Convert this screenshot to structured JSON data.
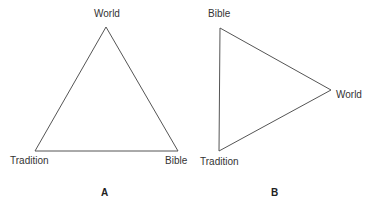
{
  "diagrams": [
    {
      "caption": "A",
      "vertices": [
        {
          "label": "World",
          "x": 106,
          "y": 27
        },
        {
          "label": "Tradition",
          "x": 35,
          "y": 151
        },
        {
          "label": "Bible",
          "x": 178,
          "y": 151
        }
      ]
    },
    {
      "caption": "B",
      "vertices": [
        {
          "label": "Bible",
          "x": 220,
          "y": 28
        },
        {
          "label": "World",
          "x": 331,
          "y": 90
        },
        {
          "label": "Tradition",
          "x": 219,
          "y": 151
        }
      ]
    }
  ],
  "colors": {
    "line": "#555555",
    "text": "#333333"
  }
}
